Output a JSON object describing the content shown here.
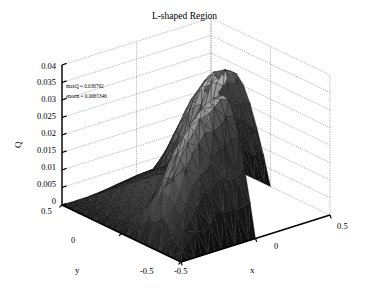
{
  "figure": {
    "title": "L-shaped Region",
    "background_color": "#ffffff",
    "text_color": "#000000",
    "axis_line_color": "#000000",
    "grid_color": "#808080",
    "mesh_edge_color": "#1a1a1a"
  },
  "annotations": [
    {
      "name": "maxq",
      "text": "maxQ = 0.036762",
      "value": 0.036762
    },
    {
      "name": "enorm",
      "text": "enorm = 0.0065346",
      "value": 0.0065346
    }
  ],
  "axes": {
    "x": {
      "label": "x",
      "ticks": [
        "-0.5",
        "0",
        "0.5"
      ],
      "tick_values": [
        -0.5,
        0,
        0.5
      ],
      "range": [
        -0.5,
        0.5
      ]
    },
    "y": {
      "label": "y",
      "ticks": [
        "0.5",
        "0",
        "-0.5"
      ],
      "tick_values": [
        0.5,
        0,
        -0.5
      ],
      "range": [
        -0.5,
        0.5
      ]
    },
    "z": {
      "label": "Q",
      "ticks": [
        "0",
        "0.005",
        "0.01",
        "0.015",
        "0.02",
        "0.025",
        "0.03",
        "0.035",
        "0.04"
      ],
      "tick_values": [
        0,
        0.005,
        0.01,
        0.015,
        0.02,
        0.025,
        0.03,
        0.035,
        0.04
      ],
      "range": [
        0,
        0.04
      ]
    }
  },
  "chart_data": {
    "type": "surface",
    "title": "L-shaped Region",
    "xlabel": "x",
    "ylabel": "y",
    "zlabel": "Q",
    "xlim": [
      -0.5,
      0.5
    ],
    "ylim": [
      -0.5,
      0.5
    ],
    "zlim": [
      0,
      0.04
    ],
    "grid": true,
    "colormap": "gray",
    "shading": "interp",
    "mesh": "triangular",
    "domain": "L-shaped: unit square [-0.5,0.5]x[-0.5,0.5] minus quadrant x>0 and y<0",
    "max_value": 0.036762,
    "error_norm": 0.0065346,
    "boundary_condition": "Q = 0 on all boundaries",
    "view_azimuth": -37.5,
    "view_elevation": 30,
    "z_tick_gridlines": [
      0,
      0.005,
      0.01,
      0.015,
      0.02,
      0.025,
      0.03,
      0.035,
      0.04
    ]
  },
  "layout": {
    "title_y": 12,
    "origin_left_x": 62,
    "origin_left_y": 205,
    "front_corner_x": 181,
    "front_corner_y": 262,
    "right_corner_x": 330,
    "right_corner_y": 215,
    "back_corner_x": 230,
    "back_corner_y": 160,
    "z_pixel_height": 140
  }
}
